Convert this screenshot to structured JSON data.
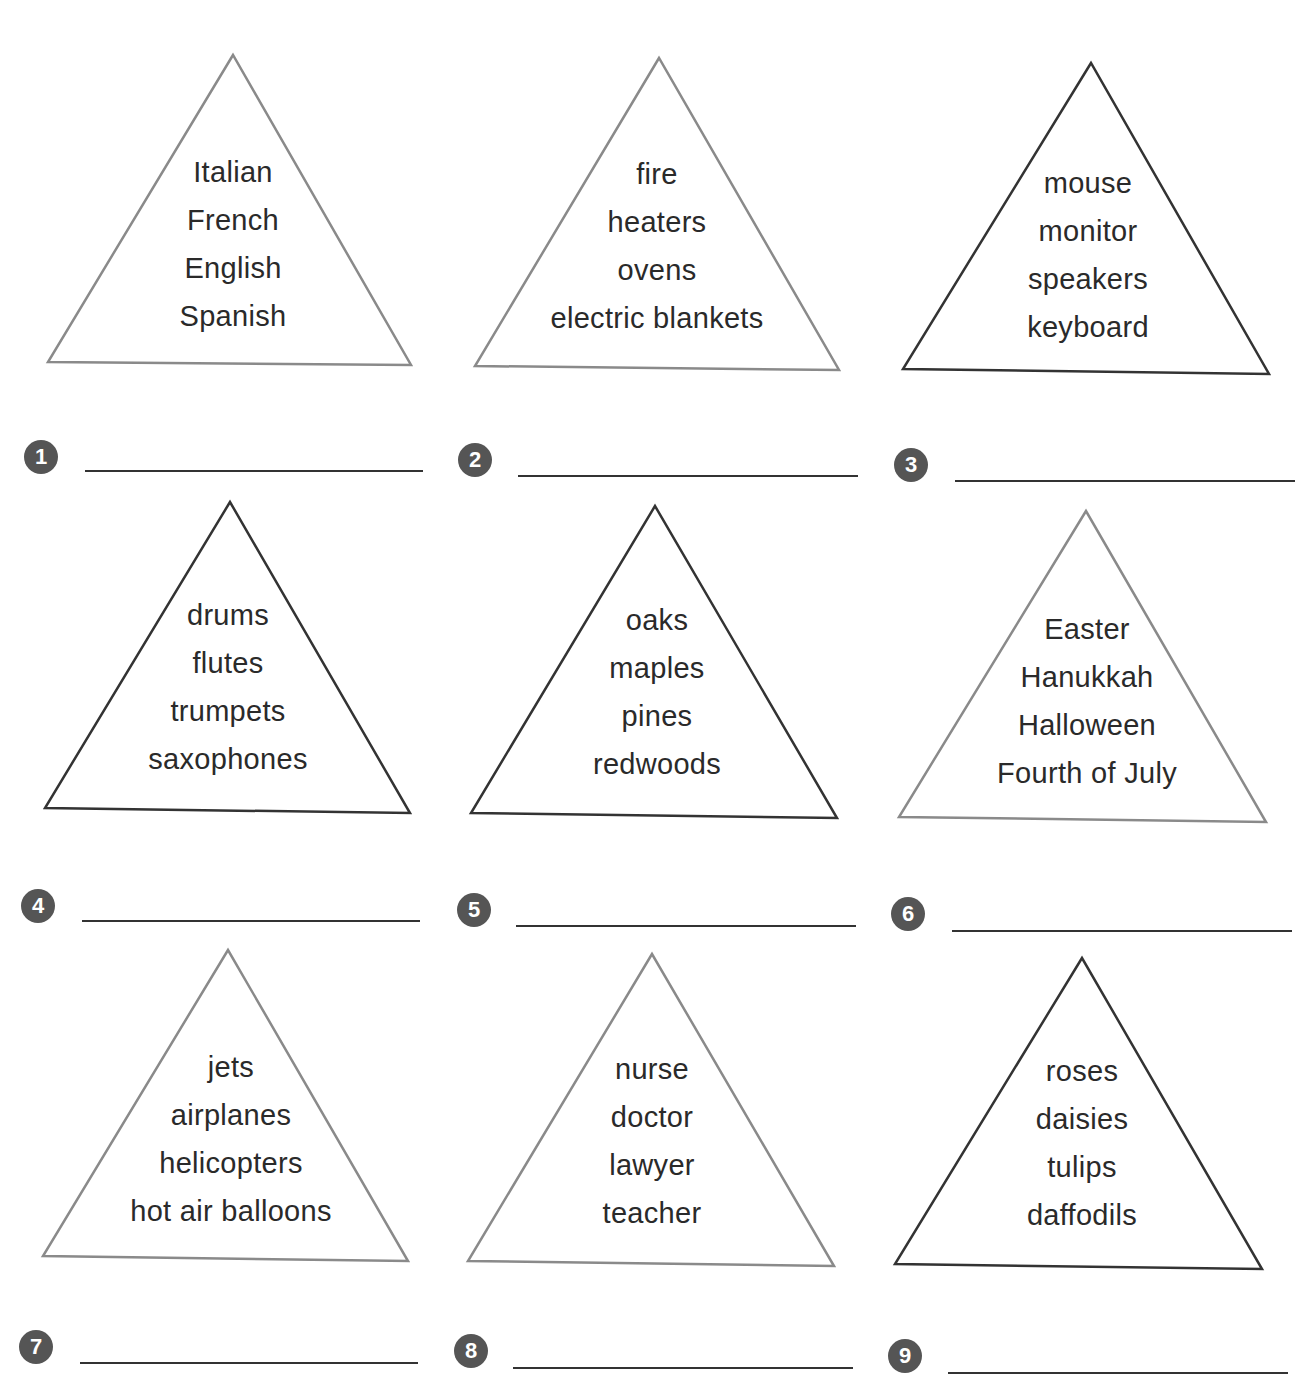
{
  "worksheet": {
    "groups": [
      {
        "number": "1",
        "words": [
          "Italian",
          "French",
          "English",
          "Spanish"
        ],
        "answer": ""
      },
      {
        "number": "2",
        "words": [
          "fire",
          "heaters",
          "ovens",
          "electric blankets"
        ],
        "answer": ""
      },
      {
        "number": "3",
        "words": [
          "mouse",
          "monitor",
          "speakers",
          "keyboard"
        ],
        "answer": ""
      },
      {
        "number": "4",
        "words": [
          "drums",
          "flutes",
          "trumpets",
          "saxophones"
        ],
        "answer": ""
      },
      {
        "number": "5",
        "words": [
          "oaks",
          "maples",
          "pines",
          "redwoods"
        ],
        "answer": ""
      },
      {
        "number": "6",
        "words": [
          "Easter",
          "Hanukkah",
          "Halloween",
          "Fourth of July"
        ],
        "answer": ""
      },
      {
        "number": "7",
        "words": [
          "jets",
          "airplanes",
          "helicopters",
          "hot air balloons"
        ],
        "answer": ""
      },
      {
        "number": "8",
        "words": [
          "nurse",
          "doctor",
          "lawyer",
          "teacher"
        ],
        "answer": ""
      },
      {
        "number": "9",
        "words": [
          "roses",
          "daisies",
          "tulips",
          "daffodils"
        ],
        "answer": ""
      }
    ]
  },
  "colors": {
    "triangle_light": "#8a8a8a",
    "triangle_dark": "#333333",
    "badge": "#555555",
    "text": "#2a2a2a"
  }
}
